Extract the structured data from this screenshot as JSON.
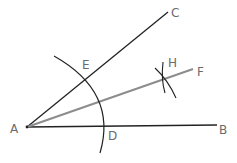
{
  "diagram": {
    "colors": {
      "line": "#222222",
      "bisector": "#8c8c8c",
      "label": "#6b6b6b"
    },
    "points": {
      "A": {
        "label": "A",
        "x": 27,
        "y": 127
      },
      "B": {
        "label": "B",
        "x": 217,
        "y": 125
      },
      "C": {
        "label": "C",
        "x": 168,
        "y": 12
      },
      "D": {
        "label": "D",
        "x": 104,
        "y": 126
      },
      "E": {
        "label": "E",
        "x": 87,
        "y": 79
      },
      "F": {
        "label": "F",
        "x": 193,
        "y": 69
      },
      "H": {
        "label": "H",
        "x": 165,
        "y": 79
      }
    },
    "segments": [
      {
        "from": "A",
        "to": "B",
        "style": "line"
      },
      {
        "from": "A",
        "to": "C",
        "style": "line"
      },
      {
        "from": "A",
        "to": "F",
        "style": "bisector"
      }
    ],
    "arcs": [
      {
        "name": "arc-ED",
        "center": "A"
      },
      {
        "name": "arc-H-from-E"
      },
      {
        "name": "arc-H-from-D"
      }
    ]
  }
}
